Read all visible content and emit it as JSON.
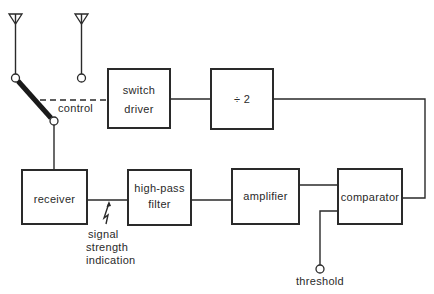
{
  "diagram": {
    "blocks": {
      "switch_driver": {
        "line1": "switch",
        "line2": "driver"
      },
      "divider": {
        "label": "÷ 2"
      },
      "receiver": {
        "label": "receiver"
      },
      "high_pass_filter": {
        "line1": "high-pass",
        "line2": "filter"
      },
      "amplifier": {
        "label": "amplifier"
      },
      "comparator": {
        "label": "comparator"
      }
    },
    "labels": {
      "control": "control",
      "signal_line1": "signal",
      "signal_line2": "strength",
      "signal_line3": "indication",
      "threshold": "threshold"
    },
    "icons": {
      "antenna_1": "antenna-icon",
      "antenna_2": "antenna-icon",
      "rf_switch": "switch-lever-icon",
      "signal_arrow": "lightning-arrow-icon"
    },
    "connections": [
      "antenna_1 -> rf_switch",
      "antenna_2 -> rf_switch",
      "rf_switch -> receiver",
      "switch_driver --control--> rf_switch",
      "divider -> switch_driver",
      "comparator -> divider",
      "receiver -> high_pass_filter",
      "high_pass_filter -> amplifier",
      "amplifier -> comparator",
      "threshold -> comparator"
    ],
    "colors": {
      "line": "#2a2a2a",
      "background": "#ffffff"
    }
  }
}
